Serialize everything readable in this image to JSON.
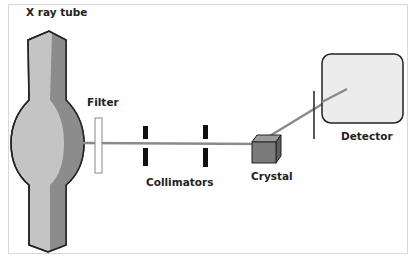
{
  "diagram": {
    "labels": {
      "xray_tube": "X ray tube",
      "filter": "Filter",
      "collimators": "Collimators",
      "crystal": "Crystal",
      "detector": "Detector"
    },
    "colors": {
      "tube_light": "#c4c4c4",
      "tube_dark": "#8c8c8c",
      "beam": "#8a8a8a",
      "crystal": "#7a7a7a",
      "detector_fill": "#ececec",
      "outline": "#222222"
    }
  }
}
